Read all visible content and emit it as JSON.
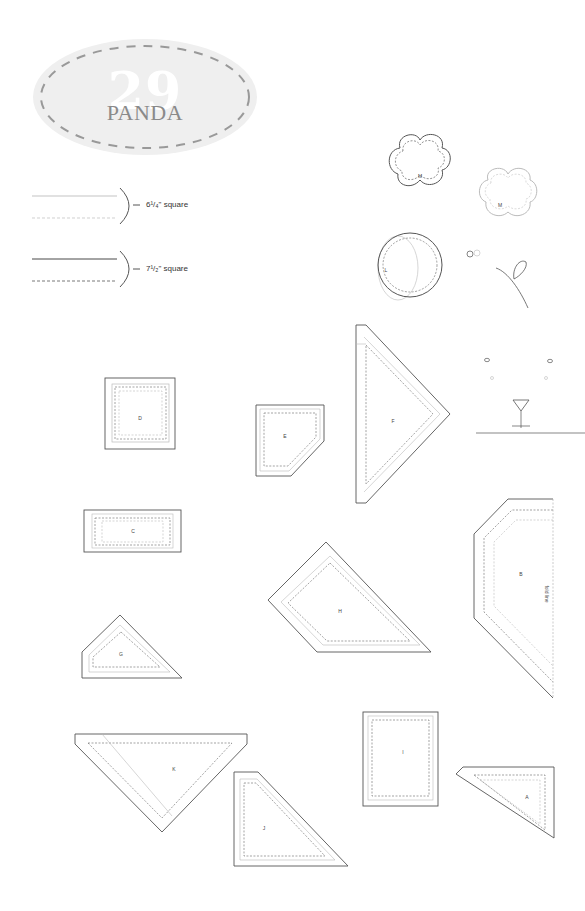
{
  "title": {
    "number": "29",
    "name": "PANDA"
  },
  "legend": [
    {
      "label": "6¹/₄\" square",
      "line_style": "light"
    },
    {
      "label": "7¹/₂\" square",
      "line_style": "dark"
    }
  ],
  "pieces": [
    {
      "id": "M",
      "label": "M",
      "shape": "flower"
    },
    {
      "id": "M2",
      "label": "M",
      "shape": "flower-light"
    },
    {
      "id": "L",
      "label": "L",
      "shape": "circle"
    },
    {
      "id": "D",
      "label": "D",
      "shape": "square"
    },
    {
      "id": "E",
      "label": "E",
      "shape": "pentagon"
    },
    {
      "id": "F",
      "label": "F",
      "shape": "triangle"
    },
    {
      "id": "C",
      "label": "C",
      "shape": "rectangle"
    },
    {
      "id": "H",
      "label": "H",
      "shape": "quad"
    },
    {
      "id": "B",
      "label": "B",
      "shape": "half-hexagon",
      "note": "fold line"
    },
    {
      "id": "G",
      "label": "G",
      "shape": "quad"
    },
    {
      "id": "K",
      "label": "K",
      "shape": "triangle"
    },
    {
      "id": "J",
      "label": "J",
      "shape": "quad"
    },
    {
      "id": "I",
      "label": "I",
      "shape": "rectangle"
    },
    {
      "id": "A",
      "label": "A",
      "shape": "triangle"
    }
  ],
  "colors": {
    "outline": "#555555",
    "light": "#bbbbbb",
    "oval": "#eeeeee"
  }
}
